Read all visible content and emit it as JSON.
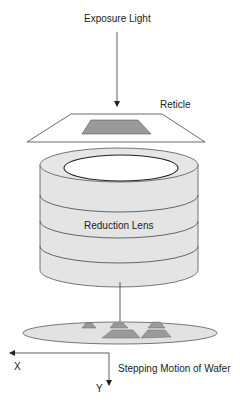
{
  "diagram": {
    "labels": {
      "exposure_light": "Exposure Light",
      "reticle": "Reticle",
      "reduction_lens": "Reduction Lens",
      "stepping_motion": "Stepping Motion of Wafer",
      "x_axis": "X",
      "y_axis": "Y"
    },
    "colors": {
      "stroke": "#333333",
      "pattern_fill": "#9a9a9a",
      "lens_fill": "#e4e4e4",
      "wafer_fill": "#e2e2e2",
      "background": "#ffffff"
    }
  }
}
